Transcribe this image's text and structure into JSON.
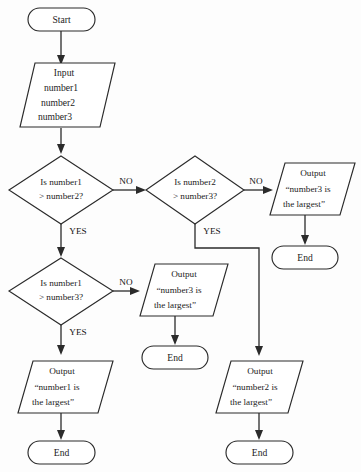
{
  "diagram": {
    "type": "flowchart",
    "title_partial": "g",
    "background_color": "#fdfdfd",
    "line_color": "#2b2b2b",
    "text_color": "#1c1c1c",
    "nodes": [
      {
        "id": "start",
        "shape": "terminator",
        "lines": [
          "Start"
        ]
      },
      {
        "id": "input",
        "shape": "parallelogram",
        "lines": [
          "Input",
          "number1",
          "number2",
          "number3"
        ]
      },
      {
        "id": "dec1",
        "shape": "diamond",
        "lines": [
          "Is number1",
          "> number2?"
        ]
      },
      {
        "id": "dec2",
        "shape": "diamond",
        "lines": [
          "Is number2",
          "> number3?"
        ]
      },
      {
        "id": "dec3",
        "shape": "diamond",
        "lines": [
          "Is number1",
          "> number3?"
        ]
      },
      {
        "id": "out3a",
        "shape": "parallelogram",
        "lines": [
          "Output",
          "“number3 is",
          "the largest”"
        ]
      },
      {
        "id": "out3b",
        "shape": "parallelogram",
        "lines": [
          "Output",
          "“number3 is",
          "the largest”"
        ]
      },
      {
        "id": "out1",
        "shape": "parallelogram",
        "lines": [
          "Output",
          "“number1 is",
          "the largest”"
        ]
      },
      {
        "id": "out2",
        "shape": "parallelogram",
        "lines": [
          "Output",
          "“number2 is",
          "the largest”"
        ]
      },
      {
        "id": "end_tr",
        "shape": "terminator",
        "lines": [
          "End"
        ]
      },
      {
        "id": "end_mid",
        "shape": "terminator",
        "lines": [
          "End"
        ]
      },
      {
        "id": "end_bl",
        "shape": "terminator",
        "lines": [
          "End"
        ]
      },
      {
        "id": "end_br",
        "shape": "terminator",
        "lines": [
          "End"
        ]
      }
    ],
    "edge_labels": {
      "dec1_no": "NO",
      "dec1_yes": "YES",
      "dec2_no": "NO",
      "dec2_yes": "YES",
      "dec3_no": "NO",
      "dec3_yes": "YES"
    }
  }
}
